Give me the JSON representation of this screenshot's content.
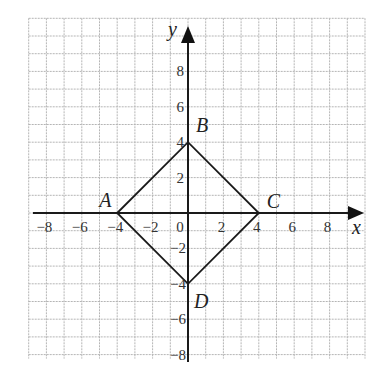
{
  "diagram": {
    "type": "coordinate-plane",
    "axes": {
      "x_label": "x",
      "y_label": "y"
    },
    "x_ticks": [
      "−8",
      "−6",
      "−4",
      "−2",
      "0",
      "2",
      "4",
      "6",
      "8"
    ],
    "y_ticks_positive": [
      "2",
      "4",
      "6",
      "8"
    ],
    "y_ticks_negative": [
      "−2",
      "−4",
      "−6",
      "−8"
    ],
    "origin_label": "0",
    "grid": {
      "x_min": -9,
      "x_max": 10,
      "y_min": -8,
      "y_max": 11
    },
    "vertices": [
      {
        "label": "A",
        "x": -4,
        "y": 0
      },
      {
        "label": "B",
        "x": 0,
        "y": 4
      },
      {
        "label": "C",
        "x": 4,
        "y": 0
      },
      {
        "label": "D",
        "x": 0,
        "y": -4
      }
    ],
    "polygon": "ABCD"
  }
}
